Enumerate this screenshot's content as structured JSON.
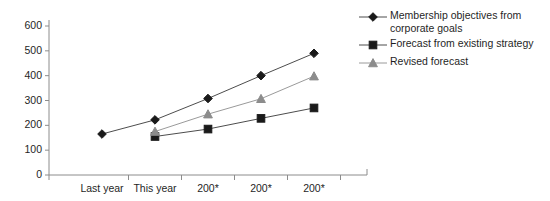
{
  "chart_data": {
    "type": "line",
    "title": "",
    "xlabel": "",
    "ylabel": "",
    "ylim": [
      0,
      600
    ],
    "ytick_step": 100,
    "grid": false,
    "legend_position": "right",
    "categories": [
      "Last year",
      "This year",
      "200*",
      "200*",
      "200*"
    ],
    "ytick_labels": [
      "600",
      "500",
      "400",
      "300",
      "200",
      "100",
      "0"
    ],
    "series": [
      {
        "name": "Membership objectives from corporate goals",
        "marker": "diamond",
        "color": "#1a1a1a",
        "line_color": "#4d4d4d",
        "values": [
          165,
          222,
          308,
          400,
          490
        ]
      },
      {
        "name": "Forecast from existing strategy",
        "marker": "square",
        "color": "#1a1a1a",
        "line_color": "#4d4d4d",
        "values": [
          null,
          155,
          185,
          228,
          270
        ]
      },
      {
        "name": "Revised forecast",
        "marker": "triangle",
        "color": "#8c8c8c",
        "line_color": "#9a9a9a",
        "values": [
          null,
          175,
          245,
          307,
          398
        ]
      }
    ]
  },
  "legend": {
    "entries": [
      {
        "label": "Membership objectives from corporate goals",
        "marker": "diamond-marker",
        "color": "#1a1a1a"
      },
      {
        "label": "Forecast from existing strategy",
        "marker": "square-marker",
        "color": "#1a1a1a"
      },
      {
        "label": "Revised forecast",
        "marker": "triangle-marker",
        "color": "#8c8c8c"
      }
    ]
  },
  "axes": {
    "y": {
      "ticks": [
        "600",
        "500",
        "400",
        "300",
        "200",
        "100",
        "0"
      ],
      "axis_color": "#8c8c8c"
    },
    "x": {
      "ticks": [
        "Last year",
        "This year",
        "200*",
        "200*",
        "200*"
      ],
      "axis_color": "#8c8c8c"
    }
  }
}
